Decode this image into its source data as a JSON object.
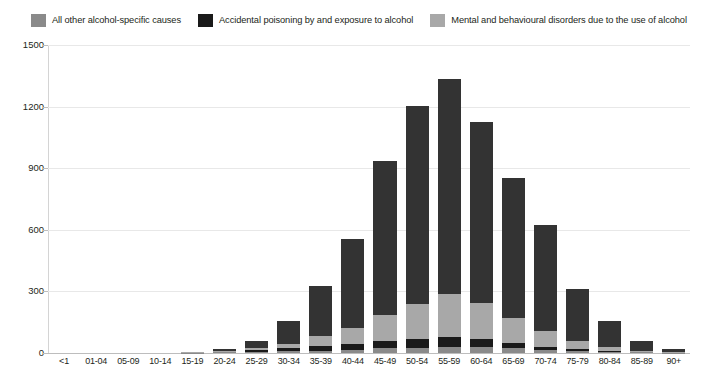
{
  "chart_data": {
    "type": "bar",
    "stacked": true,
    "title": "",
    "subtitle": "",
    "xlabel": "",
    "ylabel": "",
    "ylim": [
      0,
      1500
    ],
    "yticks": [
      0,
      300,
      600,
      900,
      1200,
      1500
    ],
    "grid": true,
    "legend_position": "top",
    "categories": [
      "<1",
      "01-04",
      "05-09",
      "10-14",
      "15-19",
      "20-24",
      "25-29",
      "30-34",
      "35-39",
      "40-44",
      "45-49",
      "50-54",
      "55-59",
      "60-64",
      "65-69",
      "70-74",
      "75-79",
      "80-84",
      "85-89",
      "90+"
    ],
    "series": [
      {
        "name": "All other alcohol-specific causes",
        "color": "#8a8a8a",
        "values": [
          0,
          0,
          0,
          0,
          1,
          4,
          6,
          9,
          12,
          16,
          22,
          26,
          30,
          28,
          22,
          17,
          11,
          6,
          3,
          1
        ]
      },
      {
        "name": "Accidental poisoning by and exposure to alcohol",
        "color": "#1a1a1a",
        "values": [
          0,
          0,
          0,
          0,
          1,
          3,
          8,
          14,
          22,
          30,
          38,
          44,
          46,
          40,
          26,
          14,
          7,
          3,
          1,
          0
        ]
      },
      {
        "name": "Mental and behavioural disorders due to the use of alcohol",
        "color": "#a8a8a8",
        "values": [
          0,
          0,
          0,
          0,
          1,
          3,
          10,
          22,
          47,
          78,
          124,
          168,
          212,
          176,
          122,
          74,
          40,
          18,
          7,
          2
        ]
      },
      {
        "name": "Alcoholic liver disease",
        "color": "#333333",
        "values": [
          0,
          0,
          0,
          0,
          2,
          8,
          36,
          110,
          244,
          430,
          750,
          967,
          1047,
          880,
          680,
          518,
          255,
          127,
          49,
          16
        ]
      }
    ],
    "totals": [
      0,
      0,
      0,
      0,
      5,
      18,
      60,
      155,
      325,
      554,
      934,
      1205,
      1335,
      1124,
      850,
      623,
      313,
      154,
      60,
      19
    ]
  },
  "legend": {
    "items": [
      {
        "label": "All other alcohol-specific causes",
        "color": "#8a8a8a"
      },
      {
        "label": "Accidental poisoning by and exposure to alcohol",
        "color": "#1a1a1a"
      },
      {
        "label": "Mental and behavioural disorders due to the use of alcohol",
        "color": "#a8a8a8"
      },
      {
        "label": "Alcoholic liver disease",
        "color": "#333333"
      }
    ]
  },
  "axes": {
    "y_tick_labels": [
      "1500",
      "1200",
      "900",
      "600",
      "300",
      "0"
    ],
    "x_tick_labels": [
      "<1",
      "01-04",
      "05-09",
      "10-14",
      "15-19",
      "20-24",
      "25-29",
      "30-34",
      "35-39",
      "40-44",
      "45-49",
      "50-54",
      "55-59",
      "60-64",
      "65-69",
      "70-74",
      "75-79",
      "80-84",
      "85-89",
      "90+"
    ]
  }
}
